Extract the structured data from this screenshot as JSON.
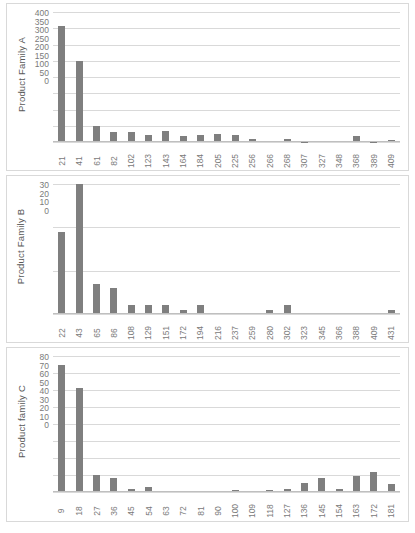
{
  "document": {
    "title": "Product family demand distribution charts",
    "bar_color": "#7f7f7f",
    "grid_color": "#d9d9d9",
    "text_color": "#595959"
  },
  "chart_data": [
    {
      "id": "chart-a",
      "type": "bar",
      "title": "",
      "ylabel": "Product Family A",
      "xlabel": "",
      "ylim": [
        0,
        400
      ],
      "yticks": [
        400,
        350,
        300,
        250,
        200,
        150,
        100,
        50,
        0
      ],
      "grid": true,
      "legend": "none",
      "categories": [
        "21",
        "41",
        "61",
        "82",
        "102",
        "123",
        "143",
        "164",
        "184",
        "205",
        "225",
        "256",
        "266",
        "268",
        "307",
        "327",
        "348",
        "368",
        "389",
        "409"
      ],
      "values": [
        356,
        248,
        48,
        30,
        32,
        23,
        34,
        17,
        21,
        24,
        22,
        8,
        4,
        8,
        1,
        2,
        3,
        17,
        1,
        6
      ]
    },
    {
      "id": "chart-b",
      "type": "bar",
      "title": "",
      "ylabel": "Product Family B",
      "xlabel": "",
      "ylim": [
        0,
        30
      ],
      "yticks": [
        30,
        20,
        10,
        0
      ],
      "grid": true,
      "legend": "none",
      "categories": [
        "22",
        "43",
        "65",
        "86",
        "108",
        "129",
        "151",
        "172",
        "194",
        "216",
        "237",
        "259",
        "280",
        "302",
        "323",
        "345",
        "366",
        "388",
        "409",
        "431"
      ],
      "values": [
        19,
        30,
        7,
        6,
        2,
        2,
        2,
        1,
        2,
        0,
        0,
        0,
        1,
        2,
        0,
        0,
        0,
        0,
        0,
        1
      ]
    },
    {
      "id": "chart-c",
      "type": "bar",
      "title": "",
      "ylabel": "Product family C",
      "xlabel": "",
      "ylim": [
        0,
        80
      ],
      "yticks": [
        80,
        70,
        60,
        50,
        40,
        30,
        20,
        10,
        0
      ],
      "grid": true,
      "legend": "none",
      "categories": [
        "9",
        "18",
        "27",
        "36",
        "45",
        "54",
        "63",
        "72",
        "81",
        "90",
        "100",
        "109",
        "118",
        "127",
        "136",
        "145",
        "154",
        "163",
        "172",
        "181"
      ],
      "values": [
        75,
        61,
        10,
        8,
        1.5,
        3,
        0.8,
        0.8,
        0,
        0.8,
        1.2,
        0,
        1.2,
        2,
        5.5,
        8,
        1.5,
        9.5,
        11.5,
        5
      ]
    }
  ]
}
